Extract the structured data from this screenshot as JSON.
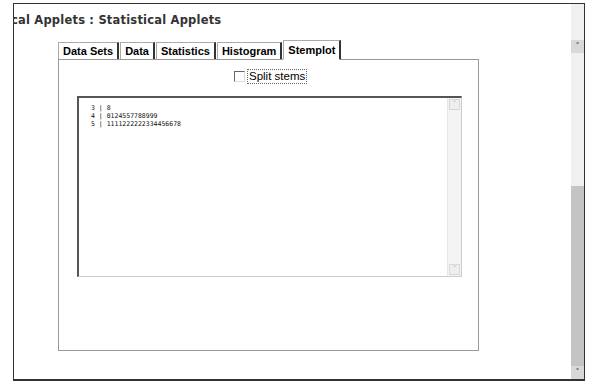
{
  "page": {
    "title": "cal Applets : Statistical Applets"
  },
  "tabs": [
    {
      "label": "Data Sets",
      "active": false
    },
    {
      "label": "Data",
      "active": false
    },
    {
      "label": "Statistics",
      "active": false
    },
    {
      "label": "Histogram",
      "active": false
    },
    {
      "label": "Stemplot",
      "active": true
    }
  ],
  "stemplot": {
    "split_stems_label": "Split stems",
    "split_stems_checked": false,
    "lines": [
      {
        "stem": "3",
        "leaves": "8"
      },
      {
        "stem": "4",
        "leaves": "0124557788999"
      },
      {
        "stem": "5",
        "leaves": "1111222222334456678"
      }
    ],
    "line_text": [
      "3 | 8",
      "4 | 0124557788999",
      "5 | 1111222222334456678"
    ]
  },
  "icons": {
    "scroll_up": "▲",
    "scroll_down": "▼",
    "chevron_up": "˄",
    "chevron_down": "˅"
  }
}
